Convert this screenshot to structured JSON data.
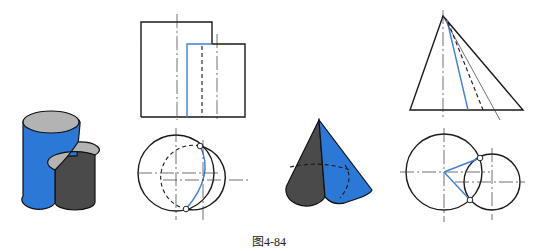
{
  "figure": {
    "caption": "图4-84",
    "colors": {
      "accent_blue": "#2b78d6",
      "dark_gray": "#4a4a4a",
      "top_gray": "#b3b3b3",
      "line": "#1a1a1a",
      "intersection_line": "#3f7fd9"
    },
    "panels": [
      {
        "name": "cylinder-pair-isometric",
        "description": "Two intersecting cylinders, shaded solid view"
      },
      {
        "name": "cylinder-pair-front-view",
        "description": "Front projection with blue intersection line"
      },
      {
        "name": "cylinder-pair-top-view",
        "description": "Top projection, two overlapping circles with intersection arc"
      },
      {
        "name": "cone-cylinder-isometric",
        "description": "Cone intersected by cylinder, shaded solid view"
      },
      {
        "name": "cone-front-view",
        "description": "Front projection of cone with blue generatrix"
      },
      {
        "name": "cone-top-view",
        "description": "Top projection with circles and blue radial lines"
      }
    ]
  }
}
